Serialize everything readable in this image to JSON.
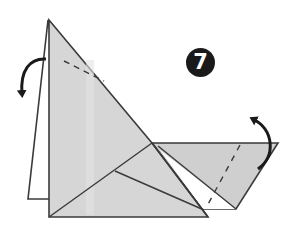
{
  "diagram": {
    "step_number": "7",
    "colors": {
      "paper": "#d2d2d2",
      "paper_light": "#dcdcdc",
      "paper_dark": "#c4c4c4",
      "outline": "#3a3a3a",
      "arrow": "#1a1a1a",
      "badge_bg": "#1a1a1a",
      "badge_text": "#ffffff"
    },
    "annotations": {
      "left_arrow": "fold-flap-backward-arrow",
      "right_arrow": "fold-flap-up-arrow",
      "top_valley_fold": "dashed-fold-line",
      "right_valley_fold": "dashed-fold-line"
    }
  }
}
